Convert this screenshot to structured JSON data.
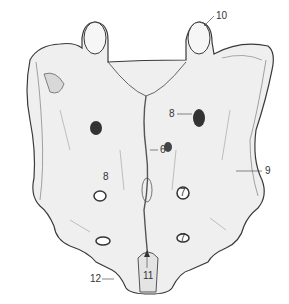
{
  "figure": {
    "colors": {
      "bone_fill": "#efefef",
      "outline": "#3a3a3a",
      "hatch": "#8a8a8a",
      "background": "#ffffff"
    }
  },
  "labels": [
    {
      "id": "10",
      "text": "10",
      "x": 216,
      "y": 11
    },
    {
      "id": "8a",
      "text": "8",
      "x": 169,
      "y": 110
    },
    {
      "id": "6",
      "text": "6",
      "x": 160,
      "y": 146
    },
    {
      "id": "9",
      "text": "9",
      "x": 265,
      "y": 167
    },
    {
      "id": "8b",
      "text": "8",
      "x": 103,
      "y": 172
    },
    {
      "id": "7a",
      "text": "7",
      "x": 180,
      "y": 189
    },
    {
      "id": "7b",
      "text": "7",
      "x": 181,
      "y": 238
    },
    {
      "id": "12",
      "text": "12",
      "x": 90,
      "y": 274
    },
    {
      "id": "11",
      "text": "11",
      "x": 144,
      "y": 271
    }
  ]
}
